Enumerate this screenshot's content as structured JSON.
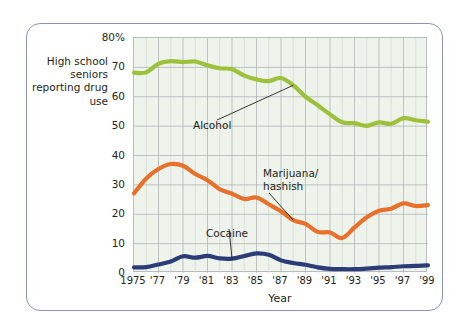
{
  "figure": {
    "y_axis_caption": "High school seniors reporting drug use",
    "x_axis_title": "Year"
  },
  "chart_data": {
    "type": "line",
    "title": "",
    "subtitle": "",
    "xlabel": "Year",
    "ylabel": "High school seniors reporting drug use",
    "xlim": [
      1975,
      1999
    ],
    "ylim": [
      0,
      80
    ],
    "grid": true,
    "legend_position": "inline-annotations",
    "y_ticks": [
      0,
      10,
      20,
      30,
      40,
      50,
      60,
      70,
      80
    ],
    "y_tick_labels": [
      "0",
      "10",
      "20",
      "30",
      "40",
      "50",
      "60",
      "70",
      "80%"
    ],
    "x_ticks": [
      1975,
      1977,
      1979,
      1981,
      1983,
      1985,
      1987,
      1989,
      1991,
      1993,
      1995,
      1997,
      1999
    ],
    "x_tick_labels": [
      "1975",
      "'77",
      "'79",
      "'81",
      "'83",
      "'85",
      "'87",
      "'89",
      "'91",
      "'93",
      "'95",
      "'97",
      "'99"
    ],
    "x": [
      1975,
      1976,
      1977,
      1978,
      1979,
      1980,
      1981,
      1982,
      1983,
      1984,
      1985,
      1986,
      1987,
      1988,
      1989,
      1990,
      1991,
      1992,
      1993,
      1994,
      1995,
      1996,
      1997,
      1998,
      1999
    ],
    "series": [
      {
        "name": "Alcohol",
        "color": "#9ec13c",
        "label": "Alcohol",
        "values": [
          68.2,
          68.3,
          71.2,
          72.1,
          71.8,
          72.0,
          70.7,
          69.7,
          69.4,
          67.2,
          65.9,
          65.3,
          66.4,
          63.9,
          60.0,
          57.1,
          54.0,
          51.3,
          51.0,
          50.1,
          51.3,
          50.8,
          52.7,
          52.0,
          51.5
        ]
      },
      {
        "name": "Marijuana/hashish",
        "color": "#e8702a",
        "label": "Marijuana/\nhashish",
        "values": [
          27.1,
          32.2,
          35.4,
          37.1,
          36.5,
          33.7,
          31.6,
          28.5,
          27.0,
          25.2,
          25.7,
          23.4,
          21.0,
          18.0,
          16.7,
          14.0,
          13.8,
          11.9,
          15.5,
          19.0,
          21.2,
          21.9,
          23.7,
          22.8,
          23.1
        ]
      },
      {
        "name": "Cocaine",
        "color": "#2b3c77",
        "label": "Cocaine",
        "values": [
          1.9,
          2.0,
          2.9,
          3.9,
          5.7,
          5.2,
          5.8,
          5.0,
          4.9,
          5.8,
          6.7,
          6.2,
          4.3,
          3.4,
          2.8,
          1.9,
          1.4,
          1.3,
          1.3,
          1.5,
          1.8,
          2.0,
          2.3,
          2.4,
          2.6
        ]
      }
    ],
    "annotations": [
      {
        "text": "Alcohol",
        "series": "Alcohol",
        "leader_to_year": 1988
      },
      {
        "text": "Marijuana/hashish",
        "series": "Marijuana/hashish",
        "leader_to_year": 1988
      },
      {
        "text": "Cocaine",
        "series": "Cocaine",
        "leader_to_year": 1983
      }
    ]
  }
}
